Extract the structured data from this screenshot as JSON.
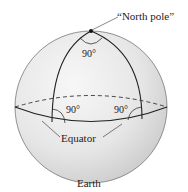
{
  "diagram": {
    "title": "Earth",
    "labels": {
      "north_pole": "“North pole”",
      "angle_top": "90°",
      "angle_left": "90°",
      "angle_right": "90°",
      "equator": "Equator",
      "earth": "Earth"
    },
    "colors": {
      "sphere_fill_light": "#f4f4f4",
      "sphere_fill_dark": "#d2d2d2",
      "line": "#333333",
      "outline": "#777777"
    }
  }
}
